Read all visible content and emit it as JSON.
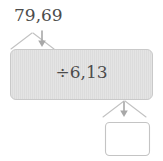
{
  "diagram": {
    "type": "function-machine",
    "title": "",
    "input": {
      "value": "79,69",
      "arrow": "down-arrow-icon"
    },
    "operation": {
      "label": "÷6,13",
      "symbol": "division-sign",
      "operand": "6,13"
    },
    "output": {
      "value": "",
      "arrow": "down-arrow-icon"
    },
    "colors": {
      "machine_fill": "#e3e3e3",
      "machine_stroke": "#c8c8c8",
      "machine_hatch": "#d5d5d5",
      "arrow": "#a6a6a6",
      "funnel": "#bfbfbf",
      "output_box_fill": "#ffffff",
      "output_box_stroke": "#c4c4c4",
      "text": "#4c4c4c",
      "background": "#ffffff"
    }
  }
}
